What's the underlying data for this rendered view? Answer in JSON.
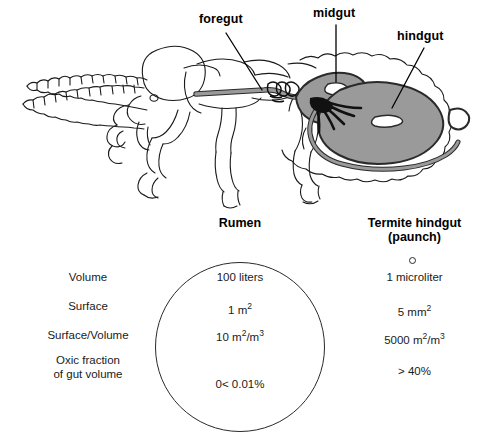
{
  "diagram": {
    "callouts": [
      {
        "id": "foregut",
        "label": "foregut"
      },
      {
        "id": "midgut",
        "label": "midgut"
      },
      {
        "id": "hindgut",
        "label": "hindgut"
      }
    ],
    "colors": {
      "gut_fill": "#9a9a9a",
      "gut_outline": "#2a2a2a",
      "body_outline": "#1a1a1a",
      "tubule_dark": "#111111",
      "background": "#ffffff"
    }
  },
  "comparison": {
    "columns": {
      "rumen": "Rumen",
      "termite_line1": "Termite hindgut",
      "termite_line2": "(paunch)"
    },
    "rows": [
      {
        "label": "Volume",
        "rumen": "100 liters",
        "termite": "1 microliter"
      },
      {
        "label": "Surface",
        "rumen_num": "1 m",
        "rumen_sup": "2",
        "termite_num": "5 mm",
        "termite_sup": "2"
      },
      {
        "label": "Surface/Volume",
        "rumen_num": "10 m",
        "rumen_sup1": "2",
        "rumen_mid": "/m",
        "rumen_sup2": "3",
        "termite_num": "5000 m",
        "termite_sup1": "2",
        "termite_mid": "/m",
        "termite_sup2": "3"
      },
      {
        "label_line1": "Oxic fraction",
        "label_line2": "of gut volume",
        "rumen": "0< 0.01%",
        "termite": "> 40%"
      }
    ]
  }
}
